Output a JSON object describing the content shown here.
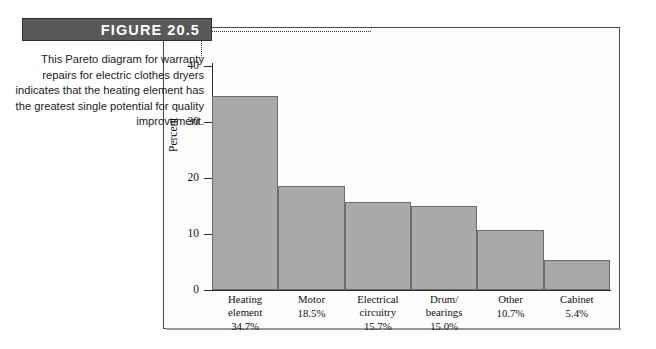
{
  "figure": {
    "banner_label": "FIGURE 20.5",
    "caption": "This Pareto diagram for warranty repairs for electric clothes dryers indicates that the heating element has the greatest single potential for quality improvement."
  },
  "colors": {
    "banner_background": "#595959",
    "banner_text": "#ffffff",
    "bar_fill": "#a9a9a9",
    "bar_stroke": "#6d6d6d",
    "axis": "#2b2b2b",
    "frame": "#4a4a4a"
  },
  "chart_data": {
    "type": "bar",
    "title": "",
    "xlabel": "",
    "ylabel": "Percent",
    "ylim": [
      0,
      40
    ],
    "yticks": [
      0,
      10,
      20,
      30,
      40
    ],
    "ytick_labels": [
      "0",
      "10",
      "20",
      "30",
      "40"
    ],
    "grid": false,
    "legend": "none",
    "bar_gap": 0,
    "categories": [
      "Heating element",
      "Motor",
      "Electrical circuitry",
      "Drum/ bearings",
      "Other",
      "Cabinet"
    ],
    "category_lines": [
      [
        "Heating",
        "element"
      ],
      [
        "Motor"
      ],
      [
        "Electrical",
        "circuitry"
      ],
      [
        "Drum/",
        "bearings"
      ],
      [
        "Other"
      ],
      [
        "Cabinet"
      ]
    ],
    "values": [
      34.7,
      18.5,
      15.7,
      15.0,
      10.7,
      5.4
    ],
    "value_labels": [
      "34.7%",
      "18.5%",
      "15.7%",
      "15.0%",
      "10.7%",
      "5.4%"
    ]
  }
}
